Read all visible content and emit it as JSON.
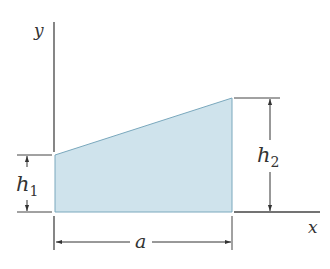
{
  "diagram": {
    "type": "trapezoid-area",
    "fill_color": "#cfe3ec",
    "edge_color": "#7aa8bd",
    "line_color": "#333333",
    "axes": {
      "x_label": "x",
      "y_label": "y"
    },
    "dimensions": {
      "left_height": {
        "symbol": "h",
        "subscript": "1"
      },
      "right_height": {
        "symbol": "h",
        "subscript": "2"
      },
      "width": {
        "symbol": "a"
      }
    }
  }
}
